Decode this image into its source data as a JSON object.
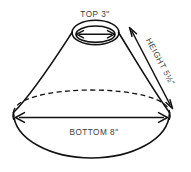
{
  "diagram": {
    "title": "Lampshade dimensions diagram",
    "shape": "truncated-cone",
    "background_color": "#ffffff",
    "line_color": "#111111",
    "text_color": "#3c3c3c",
    "labels": {
      "top": "TOP 3\"",
      "bottom": "BOTTOM 8\"",
      "height": "HEIGHT 5½\""
    },
    "measurements": {
      "top_diameter": "3\"",
      "bottom_diameter": "8\"",
      "slant_height": "5½\""
    }
  }
}
